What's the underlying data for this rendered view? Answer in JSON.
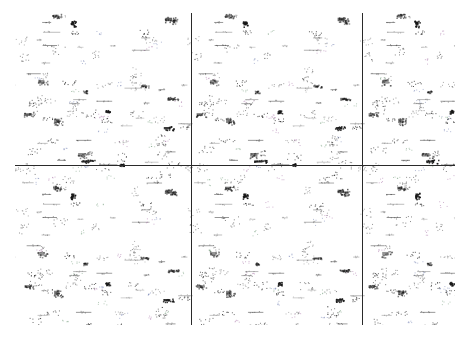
{
  "image": {
    "description": "Tiled noise texture of scattered dark speckle clusters divided by thin grid lines",
    "width": 467,
    "height": 338,
    "background": "#ffffff",
    "ink_color": "#1a1a1a",
    "accent_speckle_colors": [
      "#2f6b3a",
      "#2b3f8a",
      "#7a2a7a"
    ],
    "content_bounds": {
      "x": 15,
      "y": 13,
      "w": 440,
      "h": 312
    },
    "grid": {
      "color": "#2a2a2a",
      "vertical_x": [
        191,
        362
      ],
      "horizontal_y": [
        165
      ]
    },
    "tile_size": 172
  }
}
